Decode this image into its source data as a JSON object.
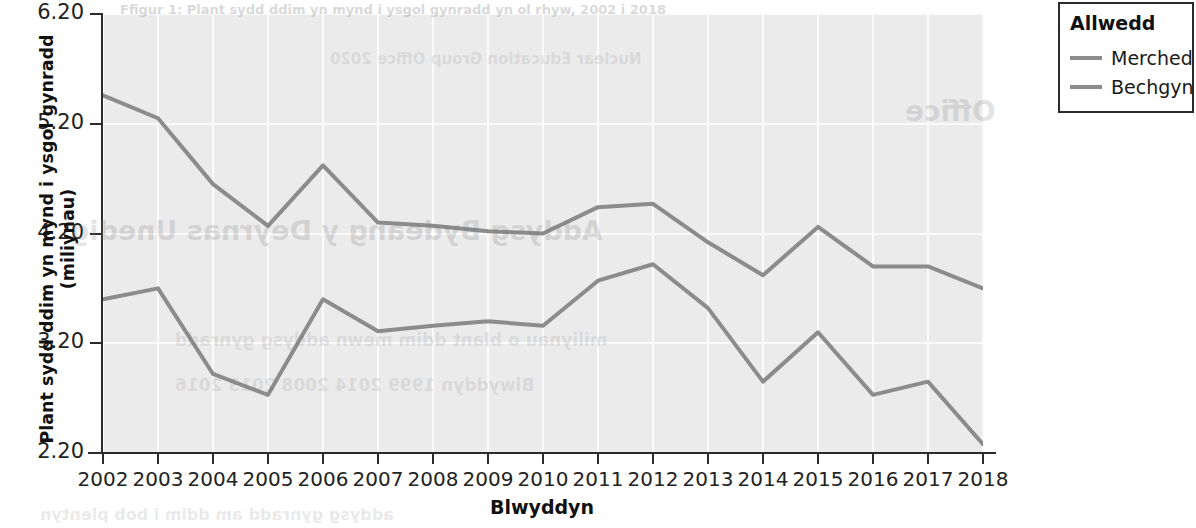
{
  "chart_data": {
    "type": "line",
    "title": "",
    "xlabel": "Blwyddyn",
    "ylabel": "Plant sydd ddim yn mynd i ysgol gynradd (miliynau)",
    "categories": [
      "2002",
      "2003",
      "2004",
      "2005",
      "2006",
      "2007",
      "2008",
      "2009",
      "2010",
      "2011",
      "2012",
      "2013",
      "2014",
      "2015",
      "2016",
      "2017",
      "2018"
    ],
    "x": [
      2002,
      2003,
      2004,
      2005,
      2006,
      2007,
      2008,
      2009,
      2010,
      2011,
      2012,
      2013,
      2014,
      2015,
      2016,
      2017,
      2018
    ],
    "xlim": [
      2002,
      2018
    ],
    "ylim": [
      2.2,
      6.2
    ],
    "yticks": [
      6.2,
      5.2,
      4.2,
      3.2,
      2.2
    ],
    "ytick_labels": [
      "6.20",
      "5.20",
      "4.20",
      "3.20",
      "2.20"
    ],
    "grid": true,
    "legend_position": "top-right-outside",
    "series": [
      {
        "name": "Merched",
        "color": "#8c8c8c",
        "values": [
          5.46,
          5.25,
          4.65,
          4.27,
          4.82,
          4.3,
          4.27,
          4.22,
          4.2,
          4.44,
          4.47,
          4.12,
          3.82,
          4.26,
          3.9,
          3.9,
          3.7
        ]
      },
      {
        "name": "Bechgyn",
        "color": "#8c8c8c",
        "values": [
          3.6,
          3.7,
          2.92,
          2.73,
          3.6,
          3.31,
          3.36,
          3.4,
          3.36,
          3.77,
          3.92,
          3.52,
          2.85,
          3.3,
          2.73,
          2.85,
          2.28
        ]
      }
    ]
  },
  "axes": {
    "ytick_labels": [
      "6.20",
      "5.20",
      "4.20",
      "3.20",
      "2.20"
    ],
    "xtick_labels": [
      "2002",
      "2003",
      "2004",
      "2005",
      "2006",
      "2007",
      "2008",
      "2009",
      "2010",
      "2011",
      "2012",
      "2013",
      "2014",
      "2015",
      "2016",
      "2017",
      "2018"
    ],
    "y_title": "Plant sydd ddim yn mynd i ysgol gynradd (miliynau)",
    "x_title": "Blwyddyn"
  },
  "legend": {
    "title": "Allwedd",
    "items": [
      {
        "label": "Merched",
        "color": "#8c8c8c"
      },
      {
        "label": "Bechgyn",
        "color": "#8c8c8c"
      }
    ]
  },
  "background_bleed": {
    "line1": "Nuclear Education Group Office 2020",
    "line2": "Office",
    "line3": "Addysg Bydeang y Deyrnas Unedig",
    "line4": "miliynau o blant ddim mewn addysg gynradd",
    "line5": "Blwyddyn 1999      2014  2008  2013  2016",
    "line6": "addysg gynradd am ddim i bob plentyn",
    "line7": "Ffigur 1: Plant sydd ddim yn mynd i ysgol gynradd yn ol rhyw, 2002 i 2018"
  },
  "colors": {
    "plot_background": "#ebebeb",
    "gridline": "#fbfbfb",
    "axis": "#2b2b2b",
    "series_line": "#8c8c8c",
    "page_background": "#ffffff"
  }
}
